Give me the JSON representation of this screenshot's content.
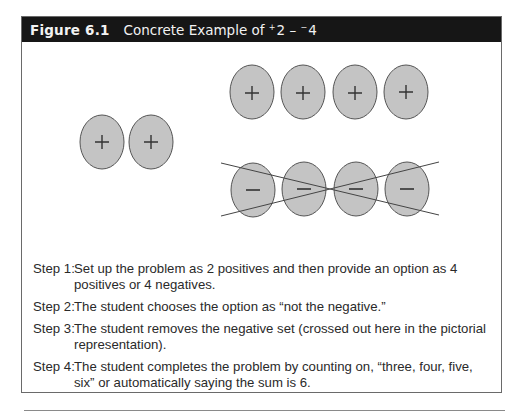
{
  "figure": {
    "number": "Figure 6.1",
    "title_prefix": "Concrete Example of ",
    "operand1_sign": "+",
    "operand1": "2",
    "operator": " – ",
    "operand2_sign": "−",
    "operand2": "4"
  },
  "diagram": {
    "colors": {
      "oval_fill": "#c4c4c4",
      "oval_stroke": "#555555",
      "cross_stroke": "#444444"
    },
    "starting_set": {
      "count": 2,
      "symbol": "+"
    },
    "positive_option": {
      "count": 4,
      "symbol": "+"
    },
    "negative_option": {
      "count": 4,
      "symbol": "–",
      "crossed_out": true
    }
  },
  "steps": [
    {
      "label": "Step 1:",
      "text": "Set up the problem as 2 positives and then provide an option as 4 positives or 4 negatives."
    },
    {
      "label": "Step 2:",
      "text": "The student chooses the option as “not the negative.”"
    },
    {
      "label": "Step 3:",
      "text": "The student removes the negative set (crossed out here in the pictorial representation)."
    },
    {
      "label": "Step 4:",
      "text": "The student completes the problem by counting on, “three, four, five, six” or automatically saying the sum is 6."
    }
  ]
}
